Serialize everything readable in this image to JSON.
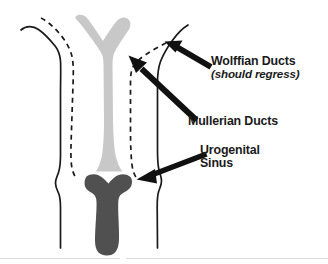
{
  "figure": {
    "background_color": "#ffffff",
    "width": 328,
    "height": 264
  },
  "colors": {
    "mullerian_fill": "#c8c8c8",
    "urogenital_fill": "#505050",
    "outline_stroke": "#1a1a1a",
    "dashed_stroke": "#1a1a1a",
    "arrow_fill": "#111111",
    "text": "#1a1a1a",
    "footer_rule": "#d9d9d9"
  },
  "labels": {
    "wolffian": {
      "title": "Wolffian Ducts",
      "note": "(should regress)"
    },
    "mullerian": {
      "title": "Mullerian Ducts"
    },
    "urogenital": {
      "line1": "Urogenital",
      "line2": "Sinus"
    }
  },
  "structures": [
    {
      "name": "mullerian-ducts",
      "label": "Mullerian Ducts",
      "style": "light-gray-solid-fill",
      "shape": "Y-shaped tube with two superior horns and a fused midline stem widening inferiorly"
    },
    {
      "name": "urogenital-sinus",
      "label": "Urogenital Sinus",
      "style": "dark-gray-solid-fill",
      "shape": "flared superior rim continuing as a vertical column with a bulbous inferior end"
    },
    {
      "name": "wolffian-ducts",
      "label": "Wolffian Ducts",
      "style": "black-dashed-line",
      "shape": "paired dashed ducts descending lateral to the Mullerian ducts"
    },
    {
      "name": "body-outline",
      "label": "Body outline",
      "style": "black-solid-line",
      "shape": "paired solid contour lines bounding the tract laterally"
    }
  ],
  "annotations": [
    {
      "name": "wolffian-arrow",
      "points_to": "wolffian-ducts",
      "direction": "up-left"
    },
    {
      "name": "mullerian-arrow",
      "points_to": "mullerian-ducts",
      "direction": "up-left"
    },
    {
      "name": "urogenital-arrow",
      "points_to": "urogenital-sinus",
      "direction": "left"
    }
  ]
}
